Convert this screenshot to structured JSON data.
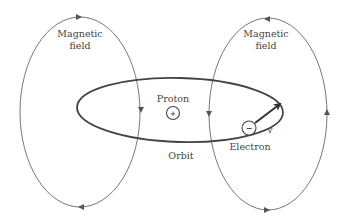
{
  "labels": {
    "left_field_line1": "Magnetic",
    "left_field_line2": "field",
    "right_field_line1": "Magnetic",
    "right_field_line2": "field",
    "proton": "Proton",
    "proton_symbol": "+",
    "electron": "Electron",
    "electron_symbol": "−",
    "velocity": "v",
    "orbit": "Orbit"
  },
  "colors": {
    "line": "#555555",
    "orbit": "#444444",
    "text": "#444444",
    "background": "#ffffff"
  }
}
